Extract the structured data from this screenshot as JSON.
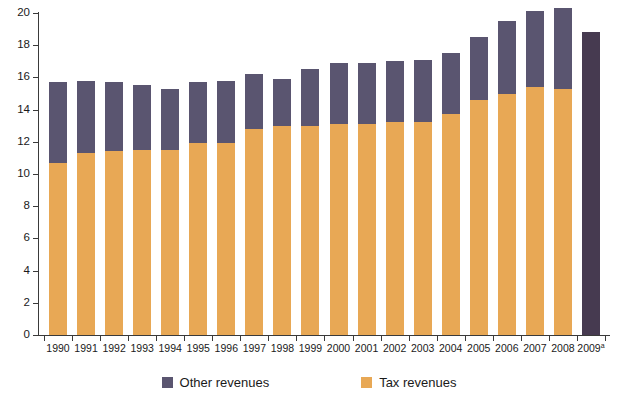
{
  "chart_data": {
    "type": "bar",
    "stacked": true,
    "title": "",
    "subtitle": "",
    "xlabel": "",
    "ylabel": "",
    "ylim": [
      0,
      20
    ],
    "ytick_step": 2,
    "yticks": [
      "0",
      "2",
      "4",
      "6",
      "8",
      "10",
      "12",
      "14",
      "16",
      "18",
      "20"
    ],
    "grid": false,
    "legend_position": "bottom-center",
    "categories": [
      "1990",
      "1991",
      "1992",
      "1993",
      "1994",
      "1995",
      "1996",
      "1997",
      "1998",
      "1999",
      "2000",
      "2001",
      "2002",
      "2003",
      "2004",
      "2005",
      "2006",
      "2007",
      "2008",
      "2009"
    ],
    "category_labels": [
      "1990",
      "1991",
      "1992",
      "1993",
      "1994",
      "1995",
      "1996",
      "1997",
      "1998",
      "1999",
      "2000",
      "2001",
      "2002",
      "2003",
      "2004",
      "2005",
      "2006",
      "2007",
      "2008",
      "2009"
    ],
    "category_footnotes": [
      "",
      "",
      "",
      "",
      "",
      "",
      "",
      "",
      "",
      "",
      "",
      "",
      "",
      "",
      "",
      "",
      "",
      "",
      "",
      "a"
    ],
    "series": [
      {
        "name": "Tax revenues",
        "color": "#e8a855",
        "values": [
          10.7,
          11.3,
          11.4,
          11.5,
          11.5,
          11.9,
          11.9,
          12.8,
          13.0,
          13.0,
          13.1,
          13.1,
          13.2,
          13.2,
          13.7,
          14.6,
          15.0,
          15.4,
          15.3,
          null
        ]
      },
      {
        "name": "Other revenues",
        "color": "#5a5570",
        "values": [
          5.0,
          4.5,
          4.3,
          4.0,
          3.8,
          3.8,
          3.9,
          3.4,
          2.9,
          3.5,
          3.8,
          3.8,
          3.8,
          3.9,
          3.8,
          3.9,
          4.5,
          4.7,
          5.0,
          18.8
        ]
      }
    ],
    "totals": [
      15.7,
      15.8,
      15.7,
      15.5,
      15.3,
      15.7,
      15.8,
      16.2,
      15.9,
      16.5,
      16.9,
      16.9,
      17.0,
      17.1,
      17.5,
      18.5,
      19.5,
      20.1,
      20.3,
      18.8
    ],
    "last_bar_single_color": "#463a50",
    "last_bar_note": "2009 shown as a single projected total bar"
  },
  "legend": {
    "items": [
      {
        "label": "Other revenues",
        "color": "#5a5570",
        "swatch_name": "legend-swatch-other-revenues"
      },
      {
        "label": "Tax revenues",
        "color": "#e8a855",
        "swatch_name": "legend-swatch-tax-revenues"
      }
    ]
  }
}
